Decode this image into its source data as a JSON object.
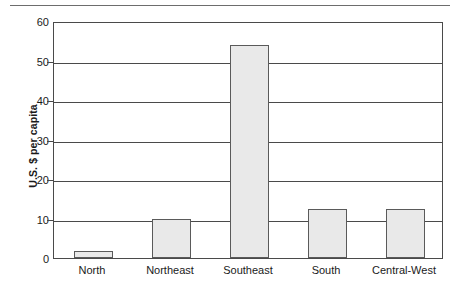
{
  "chart_data": {
    "type": "bar",
    "title": "",
    "subtitle": "",
    "xlabel": "",
    "ylabel": "U.S. $ per capita",
    "categories": [
      "North",
      "Northeast",
      "Southeast",
      "South",
      "Central-West"
    ],
    "values": [
      1.7,
      10,
      54,
      12.3,
      12.3
    ],
    "series": [
      {
        "name": "U.S. $ per capita",
        "values": [
          1.7,
          10,
          54,
          12.3,
          12.3
        ]
      }
    ],
    "ylim": [
      0,
      60
    ],
    "yticks": [
      0,
      10,
      20,
      30,
      40,
      50,
      60
    ],
    "ytick_labels": [
      "0",
      "10",
      "20",
      "30",
      "40",
      "50",
      "60"
    ],
    "xtick_labels": [
      "North",
      "Northeast",
      "Southeast",
      "South",
      "Central-West"
    ],
    "grid": "horizontal",
    "legend": "none",
    "annotations": [],
    "colors": {
      "bar_fill": "#e9e9e9",
      "bar_border": "#5a5a5a",
      "axis": "#4a4a4a",
      "grid": "#4a4a4a",
      "text": "#1a1a1a",
      "rule": "#6d6d6d"
    }
  }
}
